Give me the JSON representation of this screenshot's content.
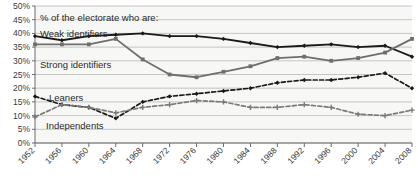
{
  "chart_data": {
    "type": "line",
    "title": "",
    "subtitle": "",
    "xlabel": "",
    "ylabel": "",
    "annotation": "% of the electorate who are:",
    "categories": [
      1952,
      1956,
      1960,
      1964,
      1968,
      1972,
      1976,
      1980,
      1984,
      1988,
      1992,
      1996,
      2000,
      2004,
      2008
    ],
    "x": [
      "1952",
      "1956",
      "1960",
      "1964",
      "1968",
      "1972",
      "1976",
      "1980",
      "1984",
      "1988",
      "1992",
      "1996",
      "2000",
      "2004",
      "2008"
    ],
    "ylim": [
      0,
      50
    ],
    "yticks": [
      "0%",
      "5%",
      "10%",
      "15%",
      "20%",
      "25%",
      "30%",
      "35%",
      "40%",
      "45%",
      "50%"
    ],
    "ytick_values": [
      0,
      5,
      10,
      15,
      20,
      25,
      30,
      35,
      40,
      45,
      50
    ],
    "grid": true,
    "legend_position": "inline-annotations",
    "series": [
      {
        "name": "Weak identifiers",
        "color": "#1a1a1a",
        "style": "solid",
        "marker": "diamond",
        "values": [
          39,
          37.5,
          39,
          39.5,
          40,
          39,
          39,
          38,
          36.5,
          35,
          35.5,
          36,
          35,
          35.5,
          31.5
        ]
      },
      {
        "name": "Strong identifiers",
        "color": "#6e6e6e",
        "style": "solid",
        "marker": "square",
        "values": [
          36,
          36,
          36,
          38,
          30.5,
          25,
          24,
          26,
          28,
          31,
          31.5,
          30,
          31,
          33,
          38
        ]
      },
      {
        "name": "Leaners",
        "color": "#1a1a1a",
        "style": "dashed",
        "marker": "diamond",
        "values": [
          17,
          14,
          13,
          9,
          15,
          17,
          18,
          19,
          20,
          22,
          23,
          23,
          24,
          25.5,
          20
        ]
      },
      {
        "name": "Independents",
        "color": "#7a7a7a",
        "style": "dashed",
        "marker": "plus",
        "values": [
          9.5,
          14,
          13,
          11,
          13,
          14,
          15.5,
          15,
          13,
          13,
          14,
          13,
          10.5,
          10,
          12
        ]
      }
    ]
  },
  "annotations": {
    "header": "% of the electorate who are:",
    "weak": "Weak identifiers",
    "strong": "Strong identifiers",
    "leaners": "Leaners",
    "independents": "Independents"
  },
  "colors": {
    "weak": "#1a1a1a",
    "strong": "#6e6e6e",
    "leaners": "#1a1a1a",
    "independents": "#7a7a7a",
    "grid": "#b9b9b9",
    "axis": "#6a6a6a",
    "plot_bg": "#f7f7f5"
  }
}
